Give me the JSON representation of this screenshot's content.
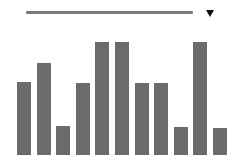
{
  "controls": {
    "slider": {
      "color": "#7a7a7a"
    },
    "dropdown": {
      "icon": "triangle-down-icon"
    }
  },
  "chart_data": {
    "type": "bar",
    "title": "",
    "xlabel": "",
    "ylabel": "",
    "grid": false,
    "categories": [
      "1",
      "2",
      "3",
      "4",
      "5",
      "6",
      "7",
      "8",
      "9",
      "10",
      "11"
    ],
    "values": [
      65,
      81,
      26,
      64,
      100,
      100,
      64,
      64,
      25,
      100,
      24
    ],
    "ylim": [
      0,
      100
    ],
    "bar_color": "#6b6b6b"
  }
}
